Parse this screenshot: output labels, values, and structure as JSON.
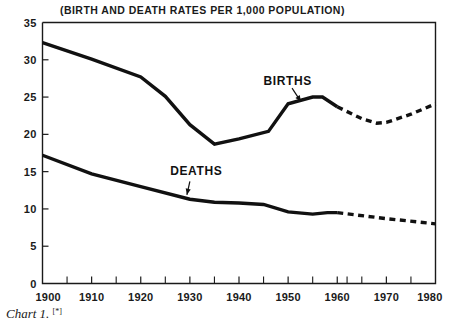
{
  "chart_data": {
    "type": "line",
    "title": "(BIRTH AND DEATH RATES PER 1,000 POPULATION)",
    "caption": "Chart 1.",
    "caption_superscript": "[*]",
    "xlabel": "",
    "ylabel": "",
    "xlim": [
      1900,
      1980
    ],
    "ylim": [
      0,
      35
    ],
    "grid": false,
    "legend_position": "inline-annotations",
    "x_ticks_major": [
      1900,
      1910,
      1920,
      1930,
      1940,
      1950,
      1960,
      1970,
      1980
    ],
    "x_tick_labels": [
      "1900",
      "1910",
      "1920",
      "1930",
      "1940",
      "1950",
      "1960",
      "1970",
      "1980"
    ],
    "x_ticks_minor": [
      1905,
      1915,
      1925,
      1935,
      1945,
      1955,
      1962,
      1965,
      1975
    ],
    "y_ticks": [
      0,
      5,
      10,
      15,
      20,
      25,
      30,
      35
    ],
    "y_tick_labels": [
      "0",
      "5",
      "10",
      "15",
      "20",
      "25",
      "30",
      "35"
    ],
    "series": [
      {
        "name": "BIRTHS",
        "label": "BIRTHS",
        "style": "solid-then-dashed",
        "color": "#111111",
        "x": [
          1900,
          1910,
          1920,
          1925,
          1930,
          1935,
          1940,
          1946,
          1950,
          1955,
          1957,
          1960
        ],
        "values": [
          32.3,
          30.1,
          27.7,
          25.1,
          21.3,
          18.7,
          19.4,
          20.4,
          24.1,
          25.0,
          25.0,
          23.7
        ],
        "projected_x": [
          1960,
          1965,
          1968,
          1970,
          1975,
          1980
        ],
        "projected_values": [
          23.7,
          22.1,
          21.5,
          21.6,
          22.7,
          24.1
        ]
      },
      {
        "name": "DEATHS",
        "label": "DEATHS",
        "style": "solid-then-dashed",
        "color": "#111111",
        "x": [
          1900,
          1910,
          1920,
          1930,
          1935,
          1940,
          1945,
          1950,
          1955,
          1958,
          1960
        ],
        "values": [
          17.2,
          14.7,
          13.0,
          11.3,
          10.9,
          10.8,
          10.6,
          9.6,
          9.3,
          9.5,
          9.5
        ],
        "projected_x": [
          1960,
          1970,
          1980
        ],
        "projected_values": [
          9.5,
          8.7,
          8.0
        ]
      }
    ],
    "annotations": [
      {
        "name": "births-callout",
        "text": "BIRTHS",
        "text_x": 1945.0,
        "text_y": 26.6,
        "arrow_from_x": 1950.8,
        "arrow_from_y": 26.2,
        "arrow_to_x": 1952.6,
        "arrow_to_y": 24.4
      },
      {
        "name": "deaths-callout",
        "text": "DEATHS",
        "text_x": 1926.0,
        "text_y": 14.6,
        "arrow_from_x": 1930.0,
        "arrow_from_y": 13.7,
        "arrow_to_x": 1929.4,
        "arrow_to_y": 11.9
      }
    ]
  }
}
